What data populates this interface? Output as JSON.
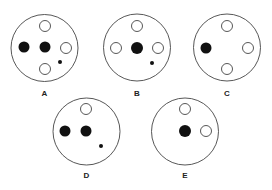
{
  "figure": {
    "panels": [
      {
        "label": "A",
        "outer": {
          "cx": 44.5,
          "cy": 48,
          "r": 33.5
        },
        "label_pos": {
          "x": 44.5,
          "y": 96
        },
        "elements": [
          {
            "type": "filled",
            "cx": 24,
            "cy": 47,
            "r": 5.5
          },
          {
            "type": "filled",
            "cx": 45,
            "cy": 47,
            "r": 5.5
          },
          {
            "type": "open",
            "cx": 45,
            "cy": 26,
            "r": 5.5
          },
          {
            "type": "open",
            "cx": 66,
            "cy": 48,
            "r": 5.5
          },
          {
            "type": "open",
            "cx": 45,
            "cy": 69,
            "r": 5.5
          },
          {
            "type": "dot",
            "cx": 60,
            "cy": 62,
            "r": 2
          }
        ]
      },
      {
        "label": "B",
        "outer": {
          "cx": 137,
          "cy": 47.5,
          "r": 33.5
        },
        "label_pos": {
          "x": 137,
          "y": 96
        },
        "elements": [
          {
            "type": "open",
            "cx": 137,
            "cy": 26,
            "r": 5.5
          },
          {
            "type": "open",
            "cx": 116,
            "cy": 48,
            "r": 5.5
          },
          {
            "type": "filled",
            "cx": 137,
            "cy": 48,
            "r": 6
          },
          {
            "type": "open",
            "cx": 158,
            "cy": 48,
            "r": 5.5
          },
          {
            "type": "dot",
            "cx": 152,
            "cy": 63,
            "r": 2
          }
        ]
      },
      {
        "label": "C",
        "outer": {
          "cx": 227,
          "cy": 47.5,
          "r": 33.5
        },
        "label_pos": {
          "x": 227,
          "y": 96
        },
        "elements": [
          {
            "type": "open",
            "cx": 227,
            "cy": 26,
            "r": 5.5
          },
          {
            "type": "filled",
            "cx": 206,
            "cy": 48,
            "r": 5.5
          },
          {
            "type": "open",
            "cx": 248,
            "cy": 48,
            "r": 5.5
          },
          {
            "type": "open",
            "cx": 227,
            "cy": 69,
            "r": 5.5
          }
        ]
      },
      {
        "label": "D",
        "outer": {
          "cx": 86.5,
          "cy": 131.5,
          "r": 33.5
        },
        "label_pos": {
          "x": 86.5,
          "y": 178
        },
        "elements": [
          {
            "type": "open",
            "cx": 86,
            "cy": 109,
            "r": 5.5
          },
          {
            "type": "filled",
            "cx": 65,
            "cy": 131,
            "r": 5.5
          },
          {
            "type": "filled",
            "cx": 86,
            "cy": 131,
            "r": 5.5
          },
          {
            "type": "dot",
            "cx": 101,
            "cy": 146,
            "r": 2
          }
        ]
      },
      {
        "label": "E",
        "outer": {
          "cx": 185,
          "cy": 131.5,
          "r": 33.5
        },
        "label_pos": {
          "x": 185,
          "y": 178
        },
        "elements": [
          {
            "type": "open",
            "cx": 185,
            "cy": 109,
            "r": 5.5
          },
          {
            "type": "filled",
            "cx": 185,
            "cy": 131,
            "r": 6
          },
          {
            "type": "open",
            "cx": 206,
            "cy": 131,
            "r": 5.5
          }
        ]
      }
    ],
    "colors": {
      "stroke": "#444444",
      "fill": "#111111",
      "background": "#ffffff"
    }
  }
}
